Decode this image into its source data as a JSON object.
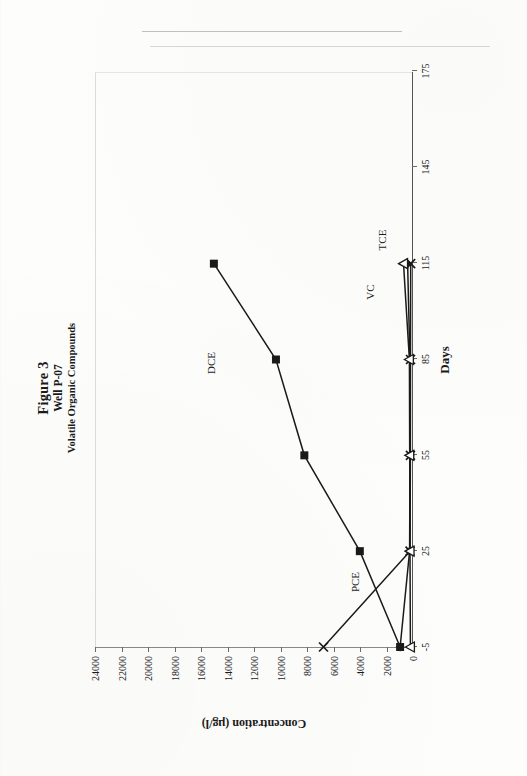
{
  "page": {
    "orientation": "figure rotated 90 degrees counter-clockwise on scanned page"
  },
  "title": {
    "main": "Figure 3",
    "sub": "Well P-07",
    "sub2": "Volatile Organic Compounds"
  },
  "axes": {
    "x_title": "Days",
    "y_title": "Concentration (µg/l)",
    "x_ticks": [
      "-5",
      "25",
      "55",
      "85",
      "115",
      "145",
      "175"
    ],
    "y_ticks": [
      "0",
      "2000",
      "4000",
      "6000",
      "8000",
      "10000",
      "12000",
      "14000",
      "16000",
      "18000",
      "20000",
      "22000",
      "24000"
    ]
  },
  "annotations": {
    "dce": "DCE",
    "pce": "PCE",
    "tce": "TCE",
    "vc": "VC"
  },
  "colors": {
    "ink": "#1a1a1a",
    "axis": "#555555",
    "paper": "#fdfdfc"
  },
  "chart_data": {
    "type": "line",
    "xlabel": "Days",
    "ylabel": "Concentration (µg/l)",
    "xlim": [
      -5,
      175
    ],
    "ylim": [
      0,
      24000
    ],
    "xticks": [
      -5,
      25,
      55,
      85,
      115,
      145,
      175
    ],
    "yticks": [
      0,
      2000,
      4000,
      6000,
      8000,
      10000,
      12000,
      14000,
      16000,
      18000,
      20000,
      22000,
      24000
    ],
    "grid": false,
    "legend": "inline annotations",
    "series": [
      {
        "name": "DCE",
        "marker": "filled-square",
        "x": [
          -5,
          25,
          55,
          85,
          115
        ],
        "y": [
          900,
          3950,
          8150,
          10300,
          15000
        ]
      },
      {
        "name": "PCE",
        "marker": "cross",
        "x": [
          -5,
          25,
          55,
          85,
          115
        ],
        "y": [
          6700,
          150,
          120,
          110,
          100
        ]
      },
      {
        "name": "TCE",
        "marker": "filled-diamond",
        "x": [
          -5,
          25,
          55,
          85,
          115
        ],
        "y": [
          900,
          180,
          150,
          160,
          330
        ]
      },
      {
        "name": "VC",
        "marker": "open-triangle",
        "x": [
          -5,
          25,
          55,
          85,
          115
        ],
        "y": [
          120,
          150,
          170,
          200,
          640
        ]
      }
    ]
  }
}
